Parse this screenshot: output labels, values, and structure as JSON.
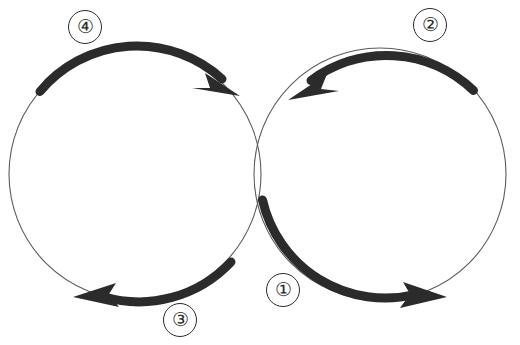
{
  "diagram": {
    "background_color": "#ffffff",
    "stroke_color": "#2b2b2b",
    "outline_color": "#5a5a5a",
    "canvas": {
      "width": 520,
      "height": 345
    },
    "circles": [
      {
        "id": "left-circle",
        "name": "left-cycle-circle",
        "cx": 135,
        "cy": 174,
        "r": 126,
        "outline_width": 1.1,
        "direction": "clockwise"
      },
      {
        "id": "right-circle",
        "name": "right-cycle-circle",
        "cx": 380,
        "cy": 174,
        "r": 126,
        "outline_width": 1.1,
        "direction": "counter-clockwise"
      }
    ],
    "arcs": [
      {
        "id": "arc-4",
        "label": "④",
        "circle": "left-circle",
        "start_angle_deg": 221,
        "end_angle_deg": 315,
        "sweep": "clockwise",
        "stroke_width": 9,
        "arrow_at": "end"
      },
      {
        "id": "arc-3",
        "label": "③",
        "circle": "left-circle",
        "start_angle_deg": 45,
        "end_angle_deg": 157,
        "sweep": "clockwise",
        "stroke_width": 9,
        "arrow_at": "end"
      },
      {
        "id": "arc-2",
        "label": "②",
        "circle": "right-circle",
        "start_angle_deg": 318,
        "end_angle_deg": 222,
        "sweep": "counter-clockwise",
        "stroke_width": 9,
        "arrow_at": "end"
      },
      {
        "id": "arc-1",
        "label": "①",
        "circle": "right-circle",
        "start_angle_deg": 160,
        "end_angle_deg": 29,
        "sweep": "counter-clockwise",
        "stroke_width": 9,
        "arrow_at": "end"
      }
    ],
    "labels": [
      {
        "id": "label-4",
        "name": "step-label-4",
        "text": "④",
        "x": 68,
        "y": 10
      },
      {
        "id": "label-2",
        "name": "step-label-2",
        "text": "②",
        "x": 413,
        "y": 8
      },
      {
        "id": "label-1",
        "name": "step-label-1",
        "text": "①",
        "x": 266,
        "y": 273
      },
      {
        "id": "label-3",
        "name": "step-label-3",
        "text": "③",
        "x": 163,
        "y": 303
      }
    ]
  }
}
